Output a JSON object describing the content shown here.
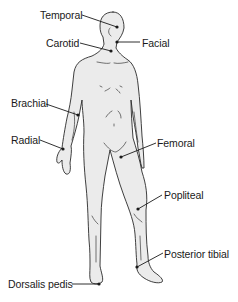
{
  "diagram": {
    "type": "anatomical-illustration",
    "colors": {
      "body_fill": "#ebebeb",
      "outline": "#2a2a2a",
      "label_text": "#1a1a1a",
      "leader_line": "#1a1a1a",
      "background": "#ffffff"
    },
    "labels": [
      {
        "id": "temporal",
        "text": "Temporal"
      },
      {
        "id": "carotid",
        "text": "Carotid"
      },
      {
        "id": "facial",
        "text": "Facial"
      },
      {
        "id": "brachial",
        "text": "Brachial"
      },
      {
        "id": "radial",
        "text": "Radial"
      },
      {
        "id": "femoral",
        "text": "Femoral"
      },
      {
        "id": "popliteal",
        "text": "Popliteal"
      },
      {
        "id": "posterior_tibial",
        "text": "Posterior tibial"
      },
      {
        "id": "dorsalis_pedis",
        "text": "Dorsalis pedis"
      }
    ]
  }
}
